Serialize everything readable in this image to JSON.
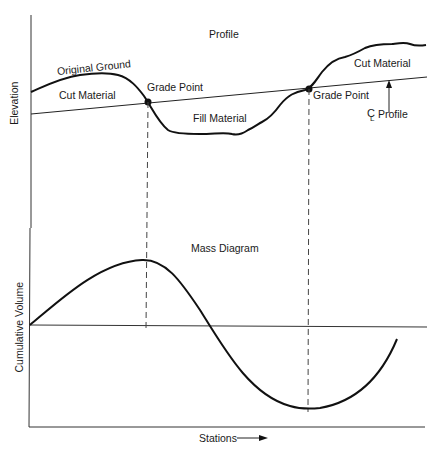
{
  "profile": {
    "title": "Profile",
    "y_axis_label": "Elevation",
    "original_ground_label": "Original Ground",
    "cut_material_left_label": "Cut Material",
    "cut_material_right_label": "Cut Material",
    "fill_material_label": "Fill Material",
    "grade_point_1_label": "Grade Point",
    "grade_point_2_label": "Grade Point",
    "centerline_symbol": "C",
    "centerline_sub": "L",
    "centerline_label": "Profile"
  },
  "mass_diagram": {
    "title": "Mass Diagram",
    "y_axis_label": "Cumulative Volume",
    "x_axis_label": "Stations"
  },
  "colors": {
    "line": "#1a1a1a",
    "background": "#ffffff"
  }
}
